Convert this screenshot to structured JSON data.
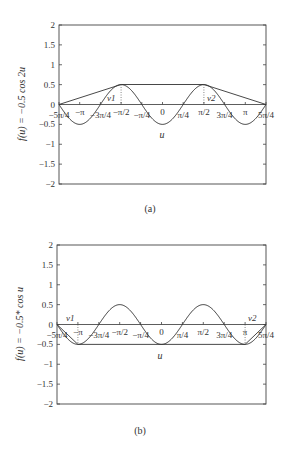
{
  "chart_data": [
    {
      "panel": "(a)",
      "type": "line",
      "title": "",
      "xlabel": "u",
      "ylabel": "f(u) = −0.5 cos 2u",
      "xlim": [
        "-5π/4",
        "5π/4"
      ],
      "ylim": [
        -2,
        2
      ],
      "yticks": [
        "2",
        "1.5",
        "1",
        "0.5",
        "0",
        "−0.5",
        "−1",
        "−1.5",
        "−2"
      ],
      "xticks": [
        "−5π/4",
        "−π",
        "−3π/4",
        "−π/2",
        "−π/4",
        "0",
        "π/4",
        "π/2",
        "3π/4",
        "π",
        "5π/4"
      ],
      "annotations": [
        "ν1",
        "ν2"
      ],
      "series": [
        {
          "name": "f(u) = -0.5 cos 2u",
          "x": [
            -3.927,
            -3.1416,
            -2.356,
            -1.5708,
            -0.785,
            0,
            0.785,
            1.5708,
            2.356,
            3.1416,
            3.927
          ],
          "y": [
            0,
            -0.5,
            0,
            0.5,
            0,
            -0.5,
            0,
            0.5,
            0,
            -0.5,
            0
          ]
        },
        {
          "name": "upper envelope",
          "x": [
            -3.927,
            -1.5708,
            1.5708,
            3.927
          ],
          "y": [
            0,
            0.5,
            0.5,
            0
          ]
        }
      ],
      "grid": false,
      "legend": "none"
    },
    {
      "panel": "(b)",
      "type": "line",
      "title": "",
      "xlabel": "u",
      "ylabel": "f(u) = −0.5* cos u",
      "xlim": [
        "-5π/4",
        "5π/4"
      ],
      "ylim": [
        -2,
        2
      ],
      "yticks": [
        "2",
        "1.5",
        "1",
        "0.5",
        "0",
        "−0.5",
        "−1",
        "−1.5",
        "−2"
      ],
      "xticks": [
        "−5π/4",
        "−π",
        "−3π/4",
        "−π/2",
        "−π/4",
        "0",
        "π/4",
        "π/2",
        "3π/4",
        "π",
        "5π/4"
      ],
      "annotations": [
        "ν1",
        "ν2"
      ],
      "series": [
        {
          "name": "f(u)",
          "x": [
            -3.927,
            -3.1416,
            -2.356,
            -1.5708,
            -0.785,
            0,
            0.785,
            1.5708,
            2.356,
            3.1416,
            3.927
          ],
          "y": [
            0,
            -0.5,
            0,
            0.5,
            0,
            -0.5,
            0,
            0.5,
            0,
            -0.5,
            0
          ]
        },
        {
          "name": "lower envelope",
          "x": [
            -3.927,
            -3.1416,
            3.1416,
            3.927
          ],
          "y": [
            0,
            -0.5,
            -0.5,
            0
          ]
        }
      ],
      "grid": false,
      "legend": "none"
    }
  ],
  "panels": [
    {
      "caption": "(a)",
      "ylabel": "f(u) = −0.5 cos 2u",
      "xlabel": "u",
      "v1": "ν1",
      "v2": "ν2"
    },
    {
      "caption": "(b)",
      "ylabel": "f(u) = −0.5* cos u",
      "xlabel": "u",
      "v1": "ν1",
      "v2": "ν2"
    }
  ],
  "yticks": [
    "2",
    "1.5",
    "1",
    "0.5",
    "0",
    "−0.5",
    "−1",
    "−1.5",
    "−2"
  ],
  "xticks": [
    "−5π/4",
    "−π",
    "−3π/4",
    "−π/2",
    "−π/4",
    "0",
    "π/4",
    "π/2",
    "3π/4",
    "π",
    "5π/4"
  ]
}
